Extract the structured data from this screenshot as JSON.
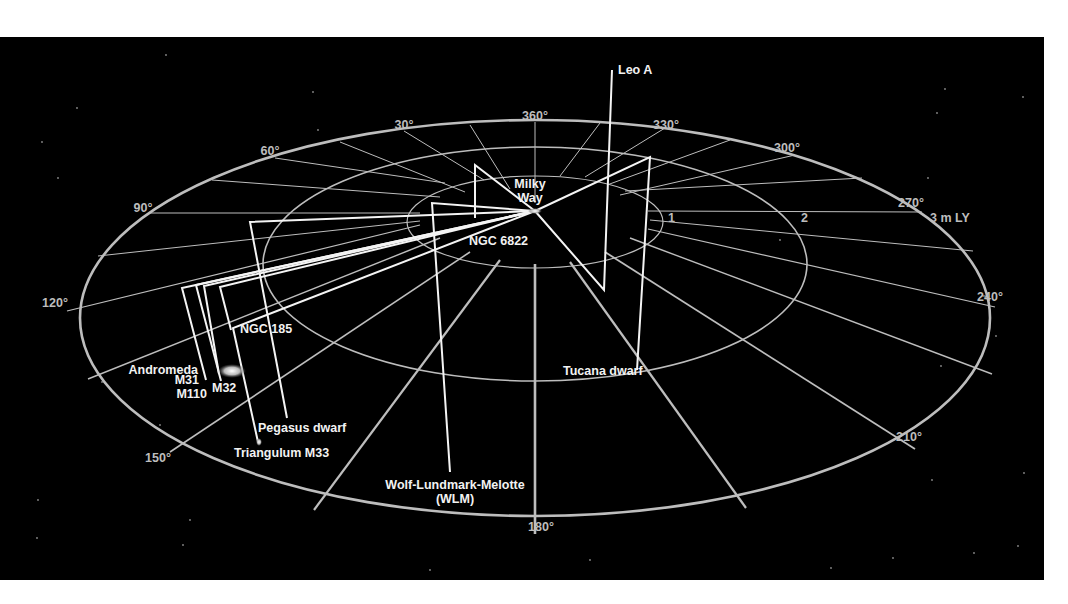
{
  "diagram": {
    "colors": {
      "background": "#000000",
      "page": "#ffffff",
      "grid": "#bdbdbd",
      "lines": "#f4f4f4",
      "text": "#f2f2f2"
    },
    "center": {
      "x": 535,
      "y": 211
    },
    "rings": [
      {
        "label": "1",
        "cx": 535,
        "cy": 222,
        "rx": 128,
        "ry": 46,
        "label_x": 668,
        "label_y": 222,
        "width": 1.2
      },
      {
        "label": "2",
        "cx": 535,
        "cy": 264,
        "rx": 272,
        "ry": 117,
        "label_x": 801,
        "label_y": 222,
        "width": 1.6
      },
      {
        "label": "3 m LY",
        "cx": 535,
        "cy": 318,
        "rx": 455,
        "ry": 198,
        "label_x": 930,
        "label_y": 222,
        "width": 2.6
      }
    ],
    "degree_labels": [
      {
        "text": "360°",
        "x": 535,
        "y": 120
      },
      {
        "text": "30°",
        "x": 404,
        "y": 129
      },
      {
        "text": "60°",
        "x": 270,
        "y": 155
      },
      {
        "text": "90°",
        "x": 143,
        "y": 212
      },
      {
        "text": "120°",
        "x": 55,
        "y": 307
      },
      {
        "text": "150°",
        "x": 158,
        "y": 462
      },
      {
        "text": "180°",
        "x": 541,
        "y": 531
      },
      {
        "text": "210°",
        "x": 909,
        "y": 441
      },
      {
        "text": "240°",
        "x": 990,
        "y": 301
      },
      {
        "text": "270°",
        "x": 911,
        "y": 207
      },
      {
        "text": "300°",
        "x": 787,
        "y": 152
      },
      {
        "text": "330°",
        "x": 666,
        "y": 129
      }
    ],
    "spokes": [
      {
        "x1": 535,
        "y1": 122,
        "x2": 535,
        "y2": 203,
        "w": 1
      },
      {
        "x1": 470,
        "y1": 125,
        "x2": 510,
        "y2": 189,
        "w": 1
      },
      {
        "x1": 404,
        "y1": 131,
        "x2": 484,
        "y2": 180,
        "w": 1
      },
      {
        "x1": 340,
        "y1": 142,
        "x2": 465,
        "y2": 192,
        "w": 1
      },
      {
        "x1": 275,
        "y1": 158,
        "x2": 445,
        "y2": 183,
        "w": 1
      },
      {
        "x1": 212,
        "y1": 180,
        "x2": 440,
        "y2": 197,
        "w": 1
      },
      {
        "x1": 150,
        "y1": 213,
        "x2": 420,
        "y2": 213,
        "w": 1
      },
      {
        "x1": 98,
        "y1": 256,
        "x2": 420,
        "y2": 221,
        "w": 1
      },
      {
        "x1": 67,
        "y1": 311,
        "x2": 420,
        "y2": 225,
        "w": 1.2
      },
      {
        "x1": 88,
        "y1": 379,
        "x2": 440,
        "y2": 238,
        "w": 1.4
      },
      {
        "x1": 170,
        "y1": 452,
        "x2": 470,
        "y2": 252,
        "w": 1.6
      },
      {
        "x1": 314,
        "y1": 510,
        "x2": 500,
        "y2": 260,
        "w": 2.2
      },
      {
        "x1": 535,
        "y1": 534,
        "x2": 535,
        "y2": 264,
        "w": 2.6
      },
      {
        "x1": 746,
        "y1": 508,
        "x2": 570,
        "y2": 262,
        "w": 2.2
      },
      {
        "x1": 915,
        "y1": 449,
        "x2": 605,
        "y2": 252,
        "w": 1.8
      },
      {
        "x1": 992,
        "y1": 374,
        "x2": 630,
        "y2": 238,
        "w": 1.4
      },
      {
        "x1": 995,
        "y1": 307,
        "x2": 648,
        "y2": 229,
        "w": 1.2
      },
      {
        "x1": 973,
        "y1": 251,
        "x2": 650,
        "y2": 220,
        "w": 1
      },
      {
        "x1": 922,
        "y1": 212,
        "x2": 648,
        "y2": 211,
        "w": 1
      },
      {
        "x1": 862,
        "y1": 178,
        "x2": 625,
        "y2": 191,
        "w": 1
      },
      {
        "x1": 795,
        "y1": 155,
        "x2": 620,
        "y2": 195,
        "w": 1
      },
      {
        "x1": 730,
        "y1": 140,
        "x2": 607,
        "y2": 185,
        "w": 1
      },
      {
        "x1": 665,
        "y1": 128,
        "x2": 585,
        "y2": 177,
        "w": 1
      },
      {
        "x1": 600,
        "y1": 123,
        "x2": 560,
        "y2": 176,
        "w": 1
      }
    ],
    "galaxies": [
      {
        "name": "Leo A",
        "path": [
          [
            535,
            211
          ],
          [
            604,
            290
          ],
          [
            612,
            70
          ]
        ],
        "label_x": 618,
        "label_y": 74,
        "anchor": "start",
        "lines": [
          "Leo A"
        ]
      },
      {
        "name": "Milky Way",
        "path": [],
        "label_x": 530,
        "label_y": 188,
        "anchor": "middle",
        "lines": [
          "Milky",
          "Way"
        ]
      },
      {
        "name": "NGC 6822",
        "path": [
          [
            535,
            211
          ],
          [
            475,
            165
          ],
          [
            475,
            218
          ]
        ],
        "label_x": 469,
        "label_y": 245,
        "anchor": "start",
        "lines": [
          "NGC 6822"
        ]
      },
      {
        "name": "Tucana dwarf",
        "path": [
          [
            535,
            211
          ],
          [
            650,
            157
          ],
          [
            637,
            370
          ]
        ],
        "label_x": 563,
        "label_y": 375,
        "anchor": "start",
        "lines": [
          "Tucana dwarf"
        ]
      },
      {
        "name": "Wolf-Lundmark-Melotte (WLM)",
        "path": [
          [
            535,
            211
          ],
          [
            432,
            203
          ],
          [
            450,
            472
          ]
        ],
        "label_x": 455,
        "label_y": 489,
        "anchor": "middle",
        "lines": [
          "Wolf-Lundmark-Melotte",
          "(WLM)"
        ]
      },
      {
        "name": "Pegasus dwarf",
        "path": [
          [
            535,
            211
          ],
          [
            250,
            222
          ],
          [
            287,
            418
          ]
        ],
        "label_x": 258,
        "label_y": 432,
        "anchor": "start",
        "lines": [
          "Pegasus dwarf"
        ]
      },
      {
        "name": "Triangulum M33",
        "path": [
          [
            535,
            211
          ],
          [
            233,
            328
          ],
          [
            258,
            442
          ]
        ],
        "label_x": 234,
        "label_y": 457,
        "anchor": "start",
        "lines": [
          "Triangulum M33"
        ]
      },
      {
        "name": "NGC 185",
        "path": [
          [
            535,
            211
          ],
          [
            220,
            287
          ],
          [
            231,
            330
          ]
        ],
        "label_x": 240,
        "label_y": 333,
        "anchor": "start",
        "lines": [
          "NGC 185"
        ]
      },
      {
        "name": "Andromeda M31",
        "path": [
          [
            535,
            211
          ],
          [
            196,
            285
          ],
          [
            221,
            381
          ]
        ],
        "label_x": 198,
        "label_y": 374,
        "anchor": "end",
        "lines": [
          "Andromeda"
        ]
      },
      {
        "name": "M31",
        "path": [
          [
            535,
            211
          ],
          [
            182,
            288
          ],
          [
            206,
            380
          ]
        ],
        "label_x": 199,
        "label_y": 384,
        "anchor": "end",
        "lines": [
          "M31"
        ]
      },
      {
        "name": "M110",
        "path": [
          [
            535,
            211
          ],
          [
            204,
            286
          ],
          [
            219,
            374
          ]
        ],
        "label_x": 207,
        "label_y": 398,
        "anchor": "end",
        "lines": [
          "M110"
        ]
      },
      {
        "name": "M32",
        "path": [],
        "label_x": 212,
        "label_y": 392,
        "anchor": "start",
        "lines": [
          "M32"
        ]
      }
    ],
    "blobs": [
      {
        "name": "andromeda-galaxy-image",
        "cx": 232,
        "cy": 371,
        "rx": 14,
        "ry": 7
      },
      {
        "name": "triangulum-galaxy-image",
        "cx": 259,
        "cy": 442,
        "rx": 3,
        "ry": 4
      },
      {
        "name": "milky-way-core",
        "cx": 535,
        "cy": 211,
        "rx": 7,
        "ry": 3
      }
    ],
    "stars": [
      [
        166,
        55
      ],
      [
        77,
        108
      ],
      [
        42,
        142
      ],
      [
        58,
        178
      ],
      [
        313,
        92
      ],
      [
        945,
        89
      ],
      [
        937,
        113
      ],
      [
        1023,
        97
      ],
      [
        928,
        178
      ],
      [
        984,
        296
      ],
      [
        941,
        366
      ],
      [
        996,
        336
      ],
      [
        1024,
        473
      ],
      [
        932,
        480
      ],
      [
        974,
        553
      ],
      [
        893,
        558
      ],
      [
        831,
        568
      ],
      [
        1018,
        546
      ],
      [
        38,
        500
      ],
      [
        190,
        520
      ],
      [
        37,
        538
      ],
      [
        183,
        545
      ],
      [
        160,
        425
      ],
      [
        102,
        382
      ],
      [
        318,
        130
      ],
      [
        780,
        240
      ],
      [
        590,
        560
      ],
      [
        430,
        570
      ]
    ]
  }
}
